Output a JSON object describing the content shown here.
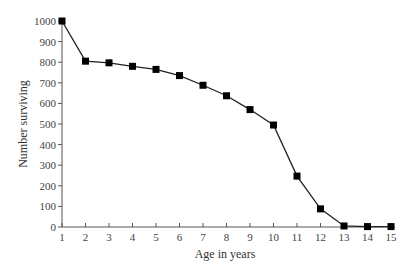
{
  "chart_data": {
    "type": "line",
    "title": "",
    "xlabel": "Age in years",
    "ylabel": "Number surviving",
    "x": [
      1,
      2,
      3,
      4,
      5,
      6,
      7,
      8,
      9,
      10,
      11,
      12,
      13,
      14,
      15
    ],
    "series": [
      {
        "name": "Number surviving",
        "marker": "square",
        "values": [
          1000,
          805,
          797,
          780,
          765,
          735,
          688,
          637,
          570,
          495,
          247,
          88,
          5,
          2,
          2
        ]
      }
    ],
    "xlim": [
      1,
      15
    ],
    "ylim": [
      0,
      1000
    ],
    "xticks": [
      "1",
      "2",
      "3",
      "4",
      "5",
      "6",
      "7",
      "8",
      "9",
      "10",
      "11",
      "12",
      "13",
      "14",
      "15"
    ],
    "yticks": [
      "0",
      "100",
      "200",
      "300",
      "400",
      "500",
      "600",
      "700",
      "800",
      "900",
      "1000"
    ],
    "grid": false,
    "legend": null,
    "colors": {
      "line": "#222222",
      "marker": "#000000",
      "axis": "#555555"
    }
  }
}
